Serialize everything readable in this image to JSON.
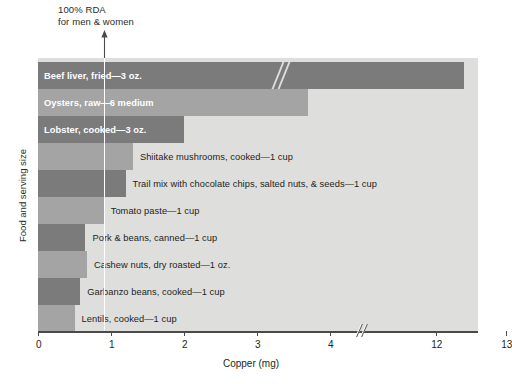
{
  "annotation": {
    "rda_text": "100% RDA\nfor men & women",
    "rda_value": 0.9,
    "arrow_icon": "up-arrow-icon"
  },
  "axes": {
    "ylabel": "Food and serving size",
    "xlabel": "Copper (mg)",
    "xticks": [
      0,
      1,
      2,
      3,
      4,
      12,
      13
    ],
    "xtick_labels": [
      "0",
      "1",
      "2",
      "3",
      "4",
      "12",
      "13"
    ],
    "axis_break_after": 4
  },
  "colors": {
    "dark_bar": "#7b7b7b",
    "light_bar": "#a4a4a4",
    "plot_background": "#dededd",
    "rda_line": "#ffffff",
    "axis": "#4a4a4a",
    "inside_label": "#ffffff",
    "outside_label": "#231f20"
  },
  "chart_data": {
    "type": "bar",
    "orientation": "horizontal",
    "title": "",
    "xlabel": "Copper (mg)",
    "ylabel": "Food and serving size",
    "xlim": [
      0,
      13
    ],
    "grid": false,
    "legend": null,
    "axis_break": {
      "from": 4.4,
      "to": 11.6
    },
    "annotations": [
      {
        "text": "100% RDA for men & women",
        "x": 0.9,
        "type": "vertical-line-with-arrow"
      }
    ],
    "categories": [
      "Beef liver, fried—3 oz.",
      "Oysters, raw—6 medium",
      "Lobster, cooked—3 oz.",
      "Shiitake mushrooms, cooked—1 cup",
      "Trail mix with chocolate chips, salted nuts, & seeds—1 cup",
      "Tomato paste—1 cup",
      "Pork & beans, canned—1 cup",
      "Cashew nuts, dry roasted—1 oz.",
      "Garbanzo beans, cooked—1 cup",
      "Lentils, cooked—1 cup"
    ],
    "values": [
      12.4,
      3.7,
      2.0,
      1.3,
      1.2,
      0.9,
      0.65,
      0.67,
      0.58,
      0.5
    ]
  },
  "bars": [
    {
      "label": "Beef liver, fried—3 oz.",
      "value": 12.4,
      "shade": "dark",
      "label_position": "inside",
      "has_break": true
    },
    {
      "label": "Oysters, raw—6 medium",
      "value": 3.7,
      "shade": "light",
      "label_position": "inside",
      "has_break": false
    },
    {
      "label": "Lobster, cooked—3 oz.",
      "value": 2.0,
      "shade": "dark",
      "label_position": "inside",
      "has_break": false
    },
    {
      "label": "Shiitake mushrooms, cooked—1 cup",
      "value": 1.3,
      "shade": "light",
      "label_position": "outside",
      "has_break": false
    },
    {
      "label": "Trail mix with chocolate chips, salted nuts, & seeds—1 cup",
      "value": 1.2,
      "shade": "dark",
      "label_position": "outside",
      "has_break": false
    },
    {
      "label": "Tomato paste—1 cup",
      "value": 0.9,
      "shade": "light",
      "label_position": "outside",
      "has_break": false
    },
    {
      "label": "Pork & beans, canned—1 cup",
      "value": 0.65,
      "shade": "dark",
      "label_position": "outside",
      "has_break": false
    },
    {
      "label": "Cashew nuts, dry roasted—1 oz.",
      "value": 0.67,
      "shade": "light",
      "label_position": "outside",
      "has_break": false
    },
    {
      "label": "Garbanzo beans, cooked—1 cup",
      "value": 0.58,
      "shade": "dark",
      "label_position": "outside",
      "has_break": false
    },
    {
      "label": "Lentils, cooked—1 cup",
      "value": 0.5,
      "shade": "light",
      "label_position": "outside",
      "has_break": false
    }
  ]
}
